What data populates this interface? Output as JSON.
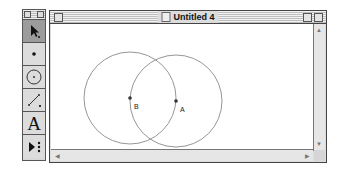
{
  "toolbox": {
    "tools": [
      {
        "name": "selection-arrow",
        "active": true
      },
      {
        "name": "point"
      },
      {
        "name": "compass"
      },
      {
        "name": "straightedge"
      },
      {
        "name": "text",
        "glyph": "A"
      },
      {
        "name": "custom-tool"
      }
    ]
  },
  "window": {
    "title": "Untitled 4"
  },
  "sketch": {
    "points": [
      {
        "label": "B",
        "x": 79,
        "y": 74
      },
      {
        "label": "A",
        "x": 125,
        "y": 77
      }
    ],
    "circles": [
      {
        "center": "B",
        "radius": 46
      },
      {
        "center": "A",
        "radius": 46
      }
    ]
  }
}
